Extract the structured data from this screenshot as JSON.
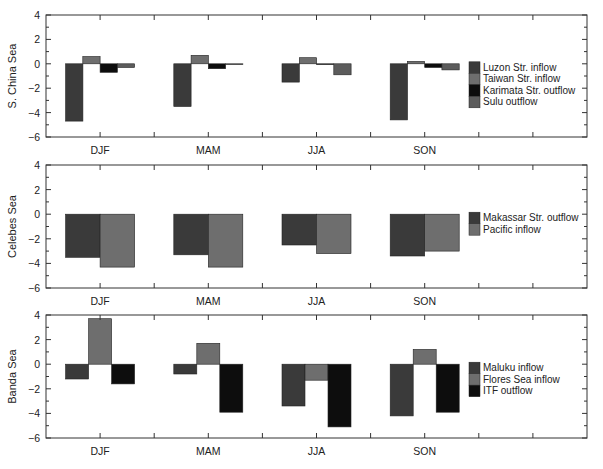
{
  "chart_data": [
    {
      "type": "bar",
      "ylabel": "S. China Sea",
      "categories": [
        "DJF",
        "MAM",
        "JJA",
        "SON"
      ],
      "ylim": [
        -6,
        4
      ],
      "yticks": [
        4,
        2,
        0,
        -2,
        -4,
        -6
      ],
      "legend_position": "right",
      "series": [
        {
          "name": "Luzon Str. inflow",
          "color": "#3a3a3a",
          "values": [
            -4.7,
            -3.5,
            -1.5,
            -4.6
          ]
        },
        {
          "name": "Taiwan Str. inflow",
          "color": "#6e6e6e",
          "values": [
            0.6,
            0.7,
            0.5,
            0.2
          ]
        },
        {
          "name": "Karimata Str. outflow",
          "color": "#0d0d0d",
          "values": [
            -0.7,
            -0.4,
            0.0,
            -0.3
          ]
        },
        {
          "name": "Sulu outflow",
          "color": "#5c5c5c",
          "values": [
            -0.3,
            0.0,
            -0.9,
            -0.5
          ]
        }
      ]
    },
    {
      "type": "bar",
      "ylabel": "Celebes Sea",
      "categories": [
        "DJF",
        "MAM",
        "JJA",
        "SON"
      ],
      "ylim": [
        -6,
        4
      ],
      "yticks": [
        4,
        2,
        0,
        -2,
        -4,
        -6
      ],
      "legend_position": "right",
      "series": [
        {
          "name": "Makassar Str. outflow",
          "color": "#3a3a3a",
          "values": [
            -3.5,
            -3.3,
            -2.5,
            -3.4
          ]
        },
        {
          "name": "Pacific inflow",
          "color": "#6e6e6e",
          "values": [
            -4.3,
            -4.3,
            -3.2,
            -3.0
          ]
        }
      ]
    },
    {
      "type": "bar",
      "ylabel": "Banda Sea",
      "categories": [
        "DJF",
        "MAM",
        "JJA",
        "SON"
      ],
      "ylim": [
        -6,
        4
      ],
      "yticks": [
        4,
        2,
        0,
        -2,
        -4,
        -6
      ],
      "legend_position": "right",
      "series": [
        {
          "name": "Maluku inflow",
          "color": "#3a3a3a",
          "values": [
            -1.2,
            -0.8,
            -3.4,
            -4.2
          ]
        },
        {
          "name": "Flores Sea inflow",
          "color": "#6e6e6e",
          "values": [
            3.7,
            1.7,
            -1.3,
            1.2
          ]
        },
        {
          "name": "ITF outflow",
          "color": "#0d0d0d",
          "values": [
            -1.6,
            -3.9,
            -5.1,
            -3.9
          ]
        }
      ]
    }
  ]
}
